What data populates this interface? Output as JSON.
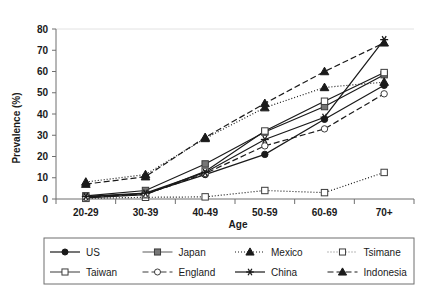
{
  "chart_data": {
    "type": "line",
    "title": "",
    "xlabel": "Age",
    "ylabel": "Prevalence (%)",
    "categories": [
      "20-29",
      "30-39",
      "40-49",
      "50-59",
      "60-69",
      "70+"
    ],
    "ylim": [
      0,
      80
    ],
    "yticks": [
      0,
      10,
      20,
      30,
      40,
      50,
      60,
      70,
      80
    ],
    "grid": false,
    "legend_position": "bottom",
    "series": [
      {
        "name": "US",
        "marker": "filled-circle",
        "line_style": "solid",
        "color": "#1a1a1a",
        "values": [
          1,
          2.5,
          11.5,
          21,
          37.5,
          53.5
        ]
      },
      {
        "name": "Japan",
        "marker": "filled-square",
        "line_style": "solid",
        "color": "#767676",
        "values": [
          1.5,
          4,
          16.5,
          31.5,
          43.5,
          58.5
        ]
      },
      {
        "name": "Mexico",
        "marker": "filled-triangle",
        "line_style": "dotted",
        "color": "#1a1a1a",
        "values": [
          8,
          11.5,
          28.5,
          43,
          52.5,
          55
        ]
      },
      {
        "name": "Tsimane",
        "marker": "open-square",
        "line_style": "dotted",
        "color": "#767676",
        "values": [
          0.3,
          0.8,
          1,
          4,
          3,
          12.5
        ]
      },
      {
        "name": "Taiwan",
        "marker": "open-square",
        "line_style": "solid",
        "color": "#5a5a5a",
        "values": [
          0.5,
          2,
          13,
          32,
          46,
          59.5
        ]
      },
      {
        "name": "England",
        "marker": "open-circle",
        "line_style": "dashed",
        "color": "#3c3c3c",
        "values": [
          0.8,
          2.2,
          12,
          25,
          33,
          49.5
        ]
      },
      {
        "name": "China",
        "marker": "asterisk",
        "line_style": "solid",
        "color": "#1a1a1a",
        "values": [
          1.2,
          2.8,
          12.5,
          28,
          38.5,
          75
        ]
      },
      {
        "name": "Indonesia",
        "marker": "filled-triangle",
        "line_style": "dashed",
        "color": "#1a1a1a",
        "values": [
          7,
          10.5,
          29,
          45,
          60,
          73.5
        ]
      }
    ]
  },
  "axes": {
    "y_label": "Prevalence (%)",
    "x_label": "Age",
    "y_ticks": [
      "0",
      "10",
      "20",
      "30",
      "40",
      "50",
      "60",
      "70",
      "80"
    ],
    "x_ticks": [
      "20-29",
      "30-39",
      "40-49",
      "50-59",
      "60-69",
      "70+"
    ]
  },
  "legend": {
    "entries": [
      {
        "label": "US"
      },
      {
        "label": "Japan"
      },
      {
        "label": "Mexico"
      },
      {
        "label": "Tsimane"
      },
      {
        "label": "Taiwan"
      },
      {
        "label": "England"
      },
      {
        "label": "China"
      },
      {
        "label": "Indonesia"
      }
    ]
  }
}
